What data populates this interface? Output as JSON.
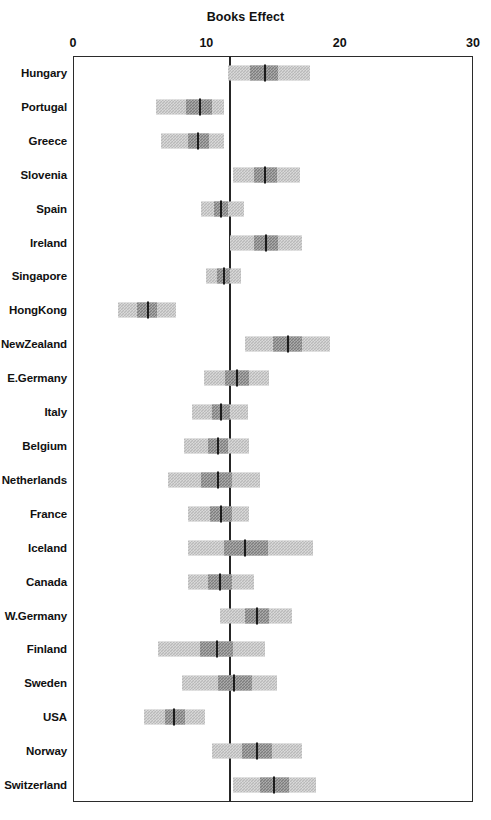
{
  "chart_data": {
    "type": "bar",
    "title": "Books Effect",
    "xlabel": "",
    "ylabel": "",
    "xlim": [
      0,
      30
    ],
    "xticks": [
      0,
      10,
      20,
      30
    ],
    "xtick_labels": [
      "0",
      "10",
      "20",
      "30"
    ],
    "grid": false,
    "legend": null,
    "orientation": "horizontal",
    "reference_line": 11.8,
    "categories": [
      "Hungary",
      "Portugal",
      "Greece",
      "Slovenia",
      "Spain",
      "Ireland",
      "Singapore",
      "HongKong",
      "NewZealand",
      "E.Germany",
      "Italy",
      "Belgium",
      "Netherlands",
      "France",
      "Iceland",
      "Canada",
      "W.Germany",
      "Finland",
      "Sweden",
      "USA",
      "Norway",
      "Switzerland"
    ],
    "rows": [
      {
        "label": "Hungary",
        "outer_low": 11.6,
        "outer_high": 17.8,
        "inner_low": 13.3,
        "inner_high": 15.4,
        "estimate": 14.4
      },
      {
        "label": "Portugal",
        "outer_low": 6.2,
        "outer_high": 11.3,
        "inner_low": 8.5,
        "inner_high": 10.4,
        "estimate": 9.5
      },
      {
        "label": "Greece",
        "outer_low": 6.6,
        "outer_high": 11.3,
        "inner_low": 8.6,
        "inner_high": 10.2,
        "estimate": 9.4
      },
      {
        "label": "Slovenia",
        "outer_low": 12.0,
        "outer_high": 17.0,
        "inner_low": 13.6,
        "inner_high": 15.3,
        "estimate": 14.4
      },
      {
        "label": "Spain",
        "outer_low": 9.6,
        "outer_high": 12.8,
        "inner_low": 10.6,
        "inner_high": 11.6,
        "estimate": 11.1
      },
      {
        "label": "Ireland",
        "outer_low": 11.8,
        "outer_high": 17.2,
        "inner_low": 13.6,
        "inner_high": 15.4,
        "estimate": 14.5
      },
      {
        "label": "Singapore",
        "outer_low": 10.0,
        "outer_high": 12.6,
        "inner_low": 10.8,
        "inner_high": 11.8,
        "estimate": 11.3
      },
      {
        "label": "HongKong",
        "outer_low": 3.4,
        "outer_high": 7.7,
        "inner_low": 4.8,
        "inner_high": 6.3,
        "estimate": 5.6
      },
      {
        "label": "NewZealand",
        "outer_low": 12.9,
        "outer_high": 19.3,
        "inner_low": 15.0,
        "inner_high": 17.2,
        "estimate": 16.1
      },
      {
        "label": "E.Germany",
        "outer_low": 9.8,
        "outer_high": 14.7,
        "inner_low": 11.4,
        "inner_high": 13.2,
        "estimate": 12.3
      },
      {
        "label": "Italy",
        "outer_low": 8.9,
        "outer_high": 13.1,
        "inner_low": 10.4,
        "inner_high": 11.8,
        "estimate": 11.1
      },
      {
        "label": "Belgium",
        "outer_low": 8.3,
        "outer_high": 13.2,
        "inner_low": 10.1,
        "inner_high": 11.6,
        "estimate": 10.9
      },
      {
        "label": "Netherlands",
        "outer_low": 7.1,
        "outer_high": 14.0,
        "inner_low": 9.6,
        "inner_high": 11.9,
        "estimate": 10.9
      },
      {
        "label": "France",
        "outer_low": 8.6,
        "outer_high": 13.2,
        "inner_low": 10.3,
        "inner_high": 11.9,
        "estimate": 11.1
      },
      {
        "label": "Iceland",
        "outer_low": 8.6,
        "outer_high": 18.0,
        "inner_low": 11.3,
        "inner_high": 14.6,
        "estimate": 12.9
      },
      {
        "label": "Canada",
        "outer_low": 8.6,
        "outer_high": 13.6,
        "inner_low": 10.1,
        "inner_high": 11.9,
        "estimate": 11.0
      },
      {
        "label": "W.Germany",
        "outer_low": 11.0,
        "outer_high": 16.4,
        "inner_low": 12.9,
        "inner_high": 14.7,
        "estimate": 13.8
      },
      {
        "label": "Finland",
        "outer_low": 6.4,
        "outer_high": 14.4,
        "inner_low": 9.5,
        "inner_high": 12.0,
        "estimate": 10.8
      },
      {
        "label": "Sweden",
        "outer_low": 8.2,
        "outer_high": 15.3,
        "inner_low": 10.9,
        "inner_high": 13.4,
        "estimate": 12.1
      },
      {
        "label": "USA",
        "outer_low": 5.3,
        "outer_high": 9.9,
        "inner_low": 6.9,
        "inner_high": 8.4,
        "estimate": 7.6
      },
      {
        "label": "Norway",
        "outer_low": 10.4,
        "outer_high": 17.2,
        "inner_low": 12.7,
        "inner_high": 14.9,
        "estimate": 13.8
      },
      {
        "label": "Switzerland",
        "outer_low": 12.0,
        "outer_high": 18.2,
        "inner_low": 14.0,
        "inner_high": 16.2,
        "estimate": 15.1
      }
    ]
  },
  "caption": ""
}
